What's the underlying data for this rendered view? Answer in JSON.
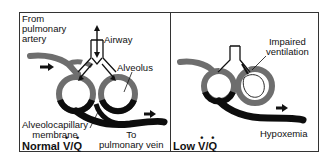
{
  "panels": [
    {
      "id": "normal",
      "title": {
        "prefix": "Normal",
        "v": "V",
        "slash": "/",
        "q": "Q"
      },
      "labels": {
        "from_artery": "From\npulmonary\nartery",
        "airway": "Airway",
        "alveolus": "Alveolus",
        "membrane": "Alveolocapillary\nmembrane",
        "to_vein": "To\npulmonary vein"
      }
    },
    {
      "id": "low",
      "title": {
        "prefix": "Low",
        "v": "V",
        "slash": "/",
        "q": "Q"
      },
      "labels": {
        "impaired": "Impaired\nventilation",
        "hypoxemia": "Hypoxemia"
      }
    }
  ],
  "colors": {
    "vessel_deoxygenated": "#6e6e6e",
    "vessel_oxygenated": "#0d0d0d",
    "outline": "#111111",
    "background": "#ffffff"
  }
}
